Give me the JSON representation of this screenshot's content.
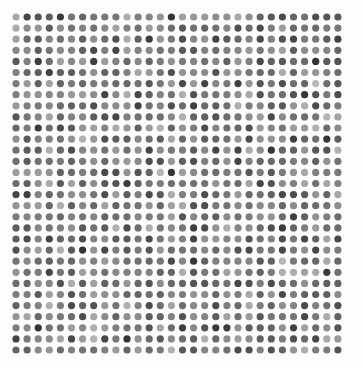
{
  "image": {
    "kind": "generated-dot-grid-texture",
    "width": 363,
    "height": 368,
    "background_color": "#fdfdfd",
    "alt_text": "Regular grid of small grayscale circles of randomly varying darkness on a white background"
  },
  "chart_data": {
    "type": "heatmap",
    "title": "",
    "subtitle": "",
    "xlabel": "",
    "ylabel": "",
    "grid": false,
    "legend": false,
    "marker": {
      "shape": "circle",
      "diameter_px": 7.2,
      "edge": "anti-aliased",
      "stroke": "none"
    },
    "layout": {
      "columns": 30,
      "rows": 31,
      "origin_x_px": 16,
      "origin_y_px": 17,
      "spacing_x_px": 11.1,
      "spacing_y_px": 11.1,
      "margin_left_px": 12,
      "margin_top_px": 13,
      "margin_right_px": 20,
      "margin_bottom_px": 15
    },
    "value_scale": {
      "encoding": "grayscale-lightness",
      "min_gray": 48,
      "max_gray": 186,
      "mean_gray": 104,
      "note": "Gray level is the only encoded variable; 0 = black, 255 = white."
    },
    "palette": [
      "#333333",
      "#3d3d3d",
      "#474747",
      "#515151",
      "#5b5b5b",
      "#656565",
      "#6f6f6f",
      "#797979",
      "#838383",
      "#8d8d8d",
      "#979797",
      "#a1a1a1",
      "#ababab",
      "#b5b5b5",
      "#bfbfbf"
    ],
    "seed": 20240117
  }
}
